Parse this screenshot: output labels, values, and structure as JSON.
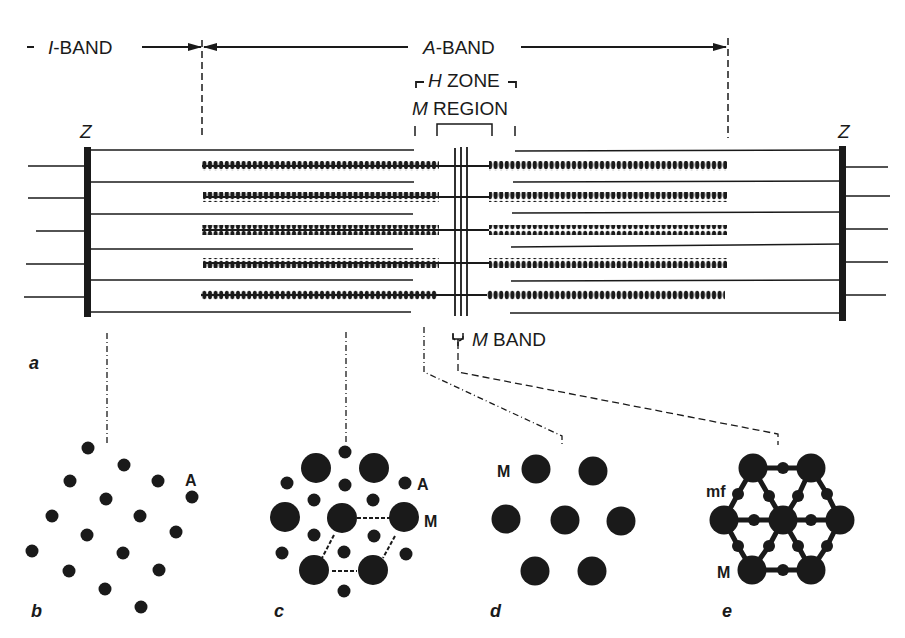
{
  "figure": {
    "labels": {
      "i_band": "I-BAND",
      "i_band_italic": "I",
      "i_band_rest": "-BAND",
      "a_band_italic": "A",
      "a_band_rest": "-BAND",
      "h_zone_italic": "H",
      "h_zone_rest": " ZONE",
      "m_region_italic": "M",
      "m_region_rest": " REGION",
      "z_left": "Z",
      "z_right": "Z",
      "m_band_italic": "M",
      "m_band_rest": " BAND",
      "panel_a": "a",
      "panel_b": "b",
      "panel_c": "c",
      "panel_d": "d",
      "panel_e": "e",
      "b_actin": "A",
      "c_actin": "A",
      "c_myosin": "M",
      "d_myosin": "M",
      "e_mf": "mf",
      "e_myosin": "M"
    },
    "colors": {
      "ink": "#1a1a1a",
      "background": "#ffffff"
    },
    "sarcomere": {
      "z_left_x": 87,
      "z_right_x": 843,
      "m_band_x": [
        457,
        462,
        467
      ],
      "thin_filament_y": [
        150,
        182,
        214,
        248,
        280,
        312
      ],
      "thick_filament_y": [
        166,
        197,
        230,
        263,
        294
      ],
      "thick_left_start": 202,
      "thick_left_end": 437,
      "thick_right_start": 489,
      "thick_right_end": 727
    },
    "panels": {
      "b": {
        "actin_dots": [
          [
            88,
            448
          ],
          [
            124,
            465
          ],
          [
            69,
            481
          ],
          [
            156,
            481
          ],
          [
            192,
            497
          ],
          [
            106,
            499
          ],
          [
            52,
            516
          ],
          [
            140,
            516
          ],
          [
            175,
            532
          ],
          [
            87,
            535
          ],
          [
            32,
            551
          ],
          [
            123,
            553
          ],
          [
            69,
            571
          ],
          [
            159,
            570
          ],
          [
            106,
            590
          ],
          [
            141,
            607
          ]
        ]
      },
      "c": {
        "myosin": [
          [
            316,
            468
          ],
          [
            374,
            468
          ],
          [
            285,
            517
          ],
          [
            342,
            518
          ],
          [
            404,
            517
          ],
          [
            314,
            570
          ],
          [
            373,
            570
          ]
        ],
        "actin": [
          [
            345,
            452
          ],
          [
            287,
            483
          ],
          [
            345,
            485
          ],
          [
            403,
            483
          ],
          [
            314,
            500
          ],
          [
            373,
            500
          ],
          [
            314,
            535
          ],
          [
            373,
            535
          ],
          [
            282,
            553
          ],
          [
            345,
            552
          ],
          [
            405,
            554
          ],
          [
            344,
            591
          ]
        ]
      },
      "d": {
        "myosin": [
          [
            536,
            468
          ],
          [
            593,
            470
          ],
          [
            506,
            519
          ],
          [
            565,
            520
          ],
          [
            621,
            521
          ],
          [
            535,
            571
          ],
          [
            592,
            571
          ]
        ]
      },
      "e": {
        "myosin": [
          [
            753,
            468
          ],
          [
            811,
            468
          ],
          [
            724,
            520
          ],
          [
            783,
            520
          ],
          [
            840,
            520
          ],
          [
            752,
            570
          ],
          [
            811,
            570
          ]
        ],
        "mf": [
          [
            783,
            470
          ],
          [
            738,
            494
          ],
          [
            769,
            496
          ],
          [
            798,
            496
          ],
          [
            827,
            494
          ],
          [
            754,
            520
          ],
          [
            811,
            520
          ],
          [
            738,
            546
          ],
          [
            769,
            546
          ],
          [
            798,
            546
          ],
          [
            827,
            546
          ],
          [
            783,
            570
          ]
        ]
      }
    }
  }
}
